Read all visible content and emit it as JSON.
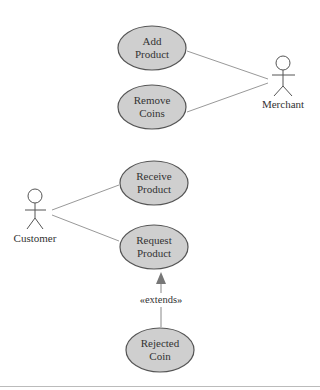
{
  "diagram": {
    "type": "uml-use-case",
    "colors": {
      "ellipse_fill": "#cfcfcf",
      "ellipse_stroke": "#555555",
      "line": "#888888",
      "text": "#333333"
    },
    "actors": [
      {
        "id": "merchant",
        "label": "Merchant"
      },
      {
        "id": "customer",
        "label": "Customer"
      }
    ],
    "use_cases": [
      {
        "id": "add_product",
        "line1": "Add",
        "line2": "Product"
      },
      {
        "id": "remove_coins",
        "line1": "Remove",
        "line2": "Coins"
      },
      {
        "id": "receive_product",
        "line1": "Receive",
        "line2": "Product"
      },
      {
        "id": "request_product",
        "line1": "Request",
        "line2": "Product"
      },
      {
        "id": "rejected_coin",
        "line1": "Rejected",
        "line2": "Coin"
      }
    ],
    "relations": [
      {
        "from": "merchant",
        "to": "add_product",
        "type": "association"
      },
      {
        "from": "merchant",
        "to": "remove_coins",
        "type": "association"
      },
      {
        "from": "customer",
        "to": "receive_product",
        "type": "association"
      },
      {
        "from": "customer",
        "to": "request_product",
        "type": "association"
      },
      {
        "from": "rejected_coin",
        "to": "request_product",
        "type": "extends",
        "label": "«extends»"
      }
    ]
  }
}
